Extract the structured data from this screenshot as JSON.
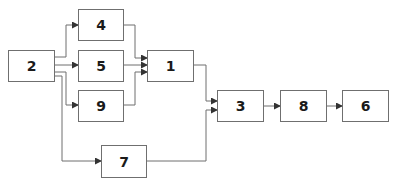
{
  "diagram": {
    "type": "block-flow",
    "colors": {
      "line": "#6f6f6f",
      "text": "#1a1a1a",
      "box_fill": "#ffffff"
    },
    "nodes": [
      {
        "id": "2",
        "label": "2"
      },
      {
        "id": "4",
        "label": "4"
      },
      {
        "id": "5",
        "label": "5"
      },
      {
        "id": "9",
        "label": "9"
      },
      {
        "id": "1",
        "label": "1"
      },
      {
        "id": "7",
        "label": "7"
      },
      {
        "id": "3",
        "label": "3"
      },
      {
        "id": "8",
        "label": "8"
      },
      {
        "id": "6",
        "label": "6"
      }
    ],
    "edges": [
      {
        "from": "2",
        "to": "4"
      },
      {
        "from": "2",
        "to": "5"
      },
      {
        "from": "2",
        "to": "9"
      },
      {
        "from": "2",
        "to": "7"
      },
      {
        "from": "4",
        "to": "1"
      },
      {
        "from": "5",
        "to": "1"
      },
      {
        "from": "9",
        "to": "1"
      },
      {
        "from": "1",
        "to": "3"
      },
      {
        "from": "7",
        "to": "3"
      },
      {
        "from": "3",
        "to": "8"
      },
      {
        "from": "8",
        "to": "6"
      }
    ]
  }
}
